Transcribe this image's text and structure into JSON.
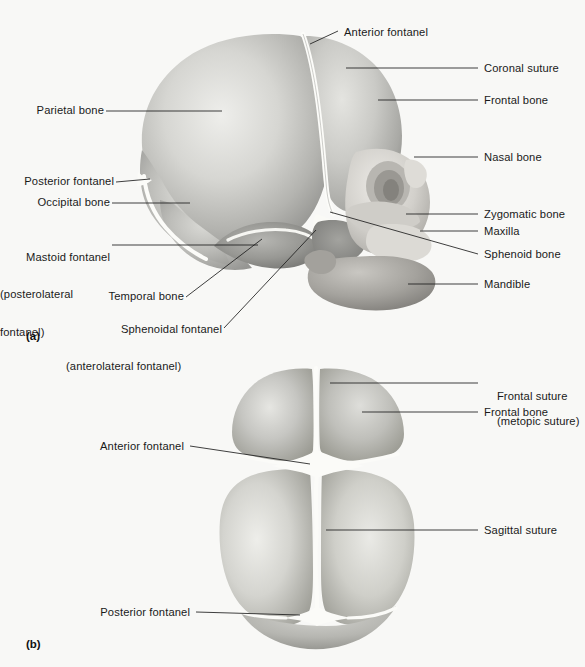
{
  "figure": {
    "title_a": "(a)",
    "title_b": "(b)",
    "background_color": "#f8f8f6",
    "line_color": "#1e1e1e",
    "bone_light": "#e9e9e6",
    "bone_mid": "#b9b9b6",
    "bone_dark": "#8d8d8a",
    "suture_color": "#fdfdfb"
  },
  "panel_a": {
    "id": "(a)",
    "view": "lateral view of fetal skull",
    "labels_left": [
      {
        "text": "Parietal bone",
        "lines": [
          "Parietal bone"
        ]
      },
      {
        "text": "Posterior fontanel",
        "lines": [
          "Posterior fontanel"
        ]
      },
      {
        "text": "Occipital bone",
        "lines": [
          "Occipital bone"
        ]
      },
      {
        "text": "Mastoid fontanel (posterolateral fontanel)",
        "lines": [
          "Mastoid fontanel",
          "(posterolateral",
          "fontanel)"
        ]
      },
      {
        "text": "Temporal bone",
        "lines": [
          "Temporal bone"
        ]
      },
      {
        "text": "Sphenoidal fontanel (anterolateral fontanel)",
        "lines": [
          "Sphenoidal fontanel",
          "(anterolateral fontanel)"
        ]
      }
    ],
    "labels_right": [
      {
        "text": "Anterior fontanel",
        "lines": [
          "Anterior fontanel"
        ]
      },
      {
        "text": "Coronal suture",
        "lines": [
          "Coronal suture"
        ]
      },
      {
        "text": "Frontal bone",
        "lines": [
          "Frontal bone"
        ]
      },
      {
        "text": "Nasal bone",
        "lines": [
          "Nasal bone"
        ]
      },
      {
        "text": "Zygomatic bone",
        "lines": [
          "Zygomatic bone"
        ]
      },
      {
        "text": "Maxilla",
        "lines": [
          "Maxilla"
        ]
      },
      {
        "text": "Sphenoid bone",
        "lines": [
          "Sphenoid bone"
        ]
      },
      {
        "text": "Mandible",
        "lines": [
          "Mandible"
        ]
      }
    ]
  },
  "panel_b": {
    "id": "(b)",
    "view": "superior view of fetal skull",
    "labels_left": [
      {
        "text": "Anterior fontanel",
        "lines": [
          "Anterior fontanel"
        ]
      },
      {
        "text": "Posterior fontanel",
        "lines": [
          "Posterior fontanel"
        ]
      }
    ],
    "labels_right": [
      {
        "text": "Frontal suture (metopic suture)",
        "lines": [
          "Frontal suture",
          "(metopic suture)"
        ]
      },
      {
        "text": "Frontal bone",
        "lines": [
          "Frontal bone"
        ]
      },
      {
        "text": "Sagittal suture",
        "lines": [
          "Sagittal suture"
        ]
      }
    ]
  }
}
